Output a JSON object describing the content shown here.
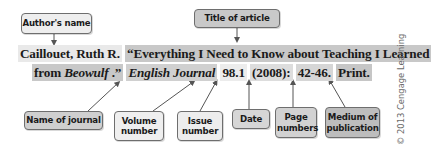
{
  "labels": {
    "author": "Author's name",
    "title": "Title of article",
    "journal": "Name of journal",
    "volume": "Volume number",
    "issue": "Issue number",
    "date": "Date",
    "pages": "Page numbers",
    "medium": "Medium of publication"
  },
  "citation": {
    "author": "Caillouet, Ruth R.",
    "title_line1": "“Everything I Need to Know about Teaching I Learned",
    "title_line2_prefix": "from ",
    "title_italic": "Beowulf",
    "title_line2_suffix": " .”",
    "journal": "English Journal",
    "volume_issue": "98.1",
    "date": "(2008):",
    "pages": "42-46.",
    "medium": "Print."
  },
  "credit": "© 2013 Cengage Learning",
  "colors": {
    "light_box": "#efefef",
    "medium_box": "#cbcbcb",
    "dark_box": "#bdbdbd",
    "border": "#6e6e6e"
  }
}
